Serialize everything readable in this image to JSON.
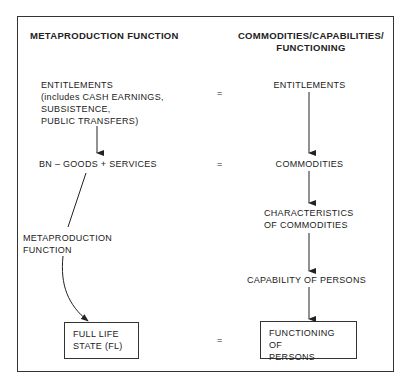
{
  "diagram": {
    "left_column": {
      "heading": "METAPRODUCTION FUNCTION",
      "entitlements": [
        "ENTITLEMENTS",
        "(includes CASH EARNINGS,",
        "SUBSISTENCE,",
        "PUBLIC TRANSFERS)"
      ],
      "bn_goods": "BN – GOODS + SERVICES",
      "metaproduction_label": [
        "METAPRODUCTION",
        "FUNCTION"
      ],
      "full_life_state": [
        "FULL LIFE",
        "STATE (FL)"
      ]
    },
    "right_column": {
      "heading": [
        "COMMODITIES/CAPABILITIES/",
        "FUNCTIONING"
      ],
      "entitlements": "ENTITLEMENTS",
      "commodities": "COMMODITIES",
      "characteristics": [
        "CHARACTERISTICS",
        "OF COMMODITIES"
      ],
      "capability": "CAPABILITY OF PERSONS",
      "functioning": [
        "FUNCTIONING OF",
        "PERSONS"
      ]
    },
    "equals_sign": "="
  }
}
